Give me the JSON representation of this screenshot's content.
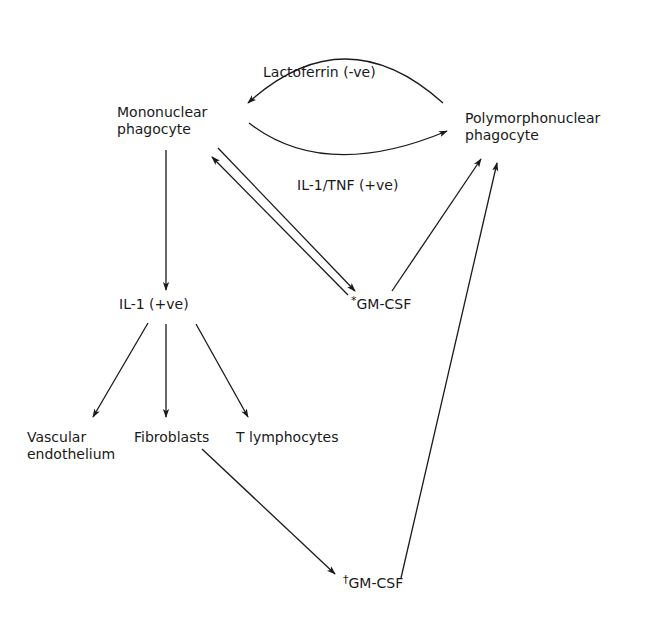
{
  "diagram": {
    "nodes": {
      "mononuclear": {
        "line1": "Mononuclear",
        "line2": "phagocyte"
      },
      "polymorphonuclear": {
        "line1": "Polymorphonuclear",
        "line2": "phagocyte"
      },
      "il1": "IL-1 (+ve)",
      "gmcsf_star": {
        "mark": "*",
        "text": "GM-CSF"
      },
      "vascular": {
        "line1": "Vascular",
        "line2": "endothelium"
      },
      "fibroblasts": "Fibroblasts",
      "tlymph": "T lymphocytes",
      "gmcsf_dagger": {
        "mark": "†",
        "text": "GM-CSF"
      }
    },
    "edge_labels": {
      "lactoferrin": "Lactoferrin (-ve)",
      "il1_tnf": "IL-1/TNF (+ve)"
    },
    "edges": [
      {
        "from": "polymorphonuclear",
        "to": "mononuclear",
        "label": "Lactoferrin (-ve)"
      },
      {
        "from": "mononuclear",
        "to": "polymorphonuclear",
        "label": "IL-1/TNF (+ve)"
      },
      {
        "from": "mononuclear",
        "to": "il1"
      },
      {
        "from": "mononuclear",
        "to": "gmcsf_star"
      },
      {
        "from": "gmcsf_star",
        "to": "mononuclear"
      },
      {
        "from": "gmcsf_star",
        "to": "polymorphonuclear"
      },
      {
        "from": "il1",
        "to": "vascular"
      },
      {
        "from": "il1",
        "to": "fibroblasts"
      },
      {
        "from": "il1",
        "to": "tlymph"
      },
      {
        "from": "fibroblasts",
        "to": "gmcsf_dagger"
      },
      {
        "from": "gmcsf_dagger",
        "to": "polymorphonuclear"
      }
    ],
    "colors": {
      "ink": "#1a1a1a",
      "background": "#ffffff"
    }
  }
}
